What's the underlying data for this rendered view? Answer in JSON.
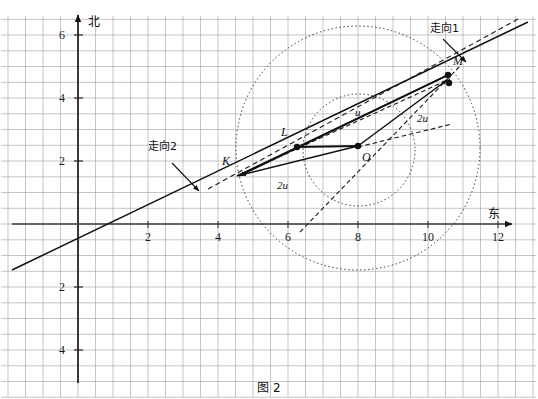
{
  "caption": "图 2",
  "axes": {
    "y_axis_name": "北",
    "x_axis_name": "东",
    "x_ticks": [
      {
        "value": 2,
        "label": "2"
      },
      {
        "value": 4,
        "label": "4"
      },
      {
        "value": 6,
        "label": "6"
      },
      {
        "value": 8,
        "label": "8"
      },
      {
        "value": 10,
        "label": "10"
      },
      {
        "value": 12,
        "label": "12"
      }
    ],
    "y_ticks": [
      {
        "value": 6,
        "label": "6"
      },
      {
        "value": 4,
        "label": "4"
      },
      {
        "value": 2,
        "label": "2"
      },
      {
        "value": -2,
        "label": "2"
      },
      {
        "value": -4,
        "label": "4"
      }
    ],
    "grid": "on",
    "grid_step": 0.5,
    "xlim": [
      -2.2,
      13.1
    ],
    "ylim": [
      -5.5,
      6.6
    ]
  },
  "annotations": [
    {
      "name": "strike1",
      "label": "走向1",
      "x": 430,
      "y": 32
    },
    {
      "name": "strike2",
      "label": "走向2",
      "x": 148,
      "y": 150
    }
  ],
  "points": [
    {
      "name": "K",
      "label": "K",
      "x": 238,
      "y": 175,
      "lx": 222,
      "ly": 165,
      "dot": false
    },
    {
      "name": "L",
      "label": "L",
      "x": 297,
      "y": 147,
      "lx": 281,
      "ly": 136,
      "dot": true
    },
    {
      "name": "O",
      "label": "O",
      "x": 358,
      "y": 146,
      "lx": 362,
      "ly": 161,
      "dot": true
    },
    {
      "name": "M",
      "label": "M",
      "x": 448,
      "y": 75,
      "lx": 453,
      "ly": 65,
      "dot": true
    },
    {
      "name": "M2",
      "label": "",
      "x": 449,
      "y": 83,
      "lx": 0,
      "ly": 0,
      "dot": true
    }
  ],
  "vector_labels": [
    {
      "name": "u-upper",
      "label": "u",
      "x": 355,
      "y": 116
    },
    {
      "name": "2u-right",
      "label": "2u",
      "x": 417,
      "y": 122
    },
    {
      "name": "2u-left",
      "label": "2u",
      "x": 277,
      "y": 189
    }
  ],
  "chart_data": {
    "type": "scatter",
    "title": "图 2",
    "xlabel": "东",
    "ylabel": "北",
    "xlim": [
      -2.2,
      13.1
    ],
    "ylim": [
      -5.5,
      6.6
    ],
    "grid": true,
    "points": [
      {
        "name": "K",
        "x": 4.6,
        "y": 1.55
      },
      {
        "name": "L",
        "x": 6.25,
        "y": 2.45
      },
      {
        "name": "O",
        "x": 8.0,
        "y": 2.5
      },
      {
        "name": "M",
        "x": 10.6,
        "y": 4.75
      }
    ],
    "circles": [
      {
        "name": "inner-circle",
        "cx": 8.0,
        "cy": 2.5,
        "r": 1.7,
        "style": "dotted"
      },
      {
        "name": "outer-circle",
        "cx": 8.0,
        "cy": 2.5,
        "r": 3.5,
        "style": "dotted"
      }
    ],
    "lines": [
      {
        "name": "strike1-solid",
        "from": [
          -2.2,
          -1.25
        ],
        "to": [
          13.1,
          5.9
        ],
        "style": "solid"
      },
      {
        "name": "strike2-dashed",
        "from": [
          3.6,
          1.2
        ],
        "to": [
          12.9,
          6.4
        ],
        "style": "dashed"
      },
      {
        "name": "K-L-M",
        "from": [
          4.6,
          1.55
        ],
        "to": [
          10.6,
          4.75
        ],
        "style": "solid"
      },
      {
        "name": "L-O",
        "from": [
          6.25,
          2.45
        ],
        "to": [
          8.0,
          2.5
        ],
        "style": "solid"
      },
      {
        "name": "O-M",
        "from": [
          8.0,
          2.5
        ],
        "to": [
          10.6,
          4.75
        ],
        "style": "solid"
      },
      {
        "name": "O-K",
        "from": [
          8.0,
          2.5
        ],
        "to": [
          4.6,
          1.55
        ],
        "style": "solid"
      }
    ],
    "legend": []
  }
}
